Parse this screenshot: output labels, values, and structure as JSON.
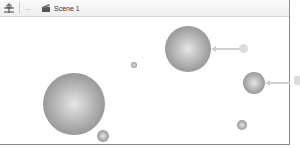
{
  "toolbar": {
    "move_tool_icon": "move-anchor-icon",
    "back_icon": "back-arrow-icon",
    "scene_icon": "scene-clapper-icon",
    "scene_label": "Scene 1"
  },
  "canvas": {
    "background": "#ffffff",
    "spheres": [
      {
        "id": "large-sphere-left",
        "cx": 74,
        "cy": 104,
        "r": 31
      },
      {
        "id": "sphere-top-right",
        "cx": 188,
        "cy": 49,
        "r": 23
      },
      {
        "id": "sphere-right",
        "cx": 254,
        "cy": 83,
        "r": 11
      },
      {
        "id": "small-sphere-bottom-left",
        "cx": 103,
        "cy": 136,
        "r": 6
      },
      {
        "id": "tiny-sphere-center",
        "cx": 134,
        "cy": 65,
        "r": 3
      },
      {
        "id": "small-sphere-bottom-right",
        "cx": 242,
        "cy": 125,
        "r": 5
      }
    ],
    "callouts": [
      {
        "target": "sphere-top-right",
        "color": "#cfcfcf"
      },
      {
        "target": "sphere-right",
        "color": "#cfcfcf"
      }
    ]
  }
}
